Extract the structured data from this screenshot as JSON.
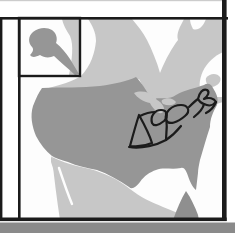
{
  "figure": {
    "regions": [
      "canada",
      "united-states",
      "alaska-inset",
      "mexico",
      "baja-california",
      "great-lakes",
      "hudson-bay",
      "atlantic-notch",
      "gulf-of-mexico",
      "highlighted-region-outline"
    ]
  },
  "colors": {
    "page-bg": "#ffffff",
    "ocean": "#fdfdfd",
    "land-light": "#c7c7c7",
    "land-dark": "#969696",
    "island-dark": "#8f8f8f",
    "outline-black": "#1b1b1b",
    "bottom-strip": "#8a8a8a",
    "top-hairline": "#cccccc"
  }
}
